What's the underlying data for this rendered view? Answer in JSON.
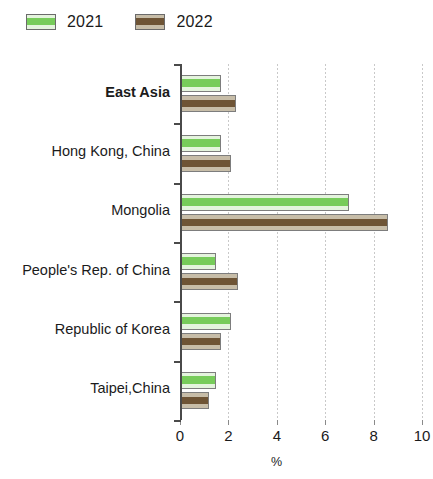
{
  "legend": {
    "position": "top-left",
    "items": [
      {
        "label": "2021",
        "color": "#77cc5a",
        "key": "2021"
      },
      {
        "label": "2022",
        "color": "#6e5435",
        "key": "2022"
      }
    ]
  },
  "axis": {
    "x_title": "%",
    "x_ticks": [
      "0",
      "2",
      "4",
      "6",
      "8",
      "10"
    ]
  },
  "chart_data": {
    "type": "bar",
    "orientation": "horizontal",
    "title": "",
    "subtitle": "",
    "xlabel": "%",
    "ylabel": "",
    "xlim": [
      0,
      10
    ],
    "xticks": [
      0,
      2,
      4,
      6,
      8,
      10
    ],
    "grid": true,
    "legend_position": "top-left",
    "categories": [
      "East Asia",
      "Hong Kong, China",
      "Mongolia",
      "People's Rep. of China",
      "Republic of Korea",
      "Taipei,China"
    ],
    "bold_categories": [
      "East Asia"
    ],
    "series": [
      {
        "name": "2021",
        "color": "#77cc5a",
        "values": [
          1.7,
          1.7,
          7.0,
          1.5,
          2.1,
          1.5
        ]
      },
      {
        "name": "2022",
        "color": "#6e5435",
        "values": [
          2.3,
          2.1,
          8.6,
          2.4,
          1.7,
          1.2
        ]
      }
    ]
  }
}
